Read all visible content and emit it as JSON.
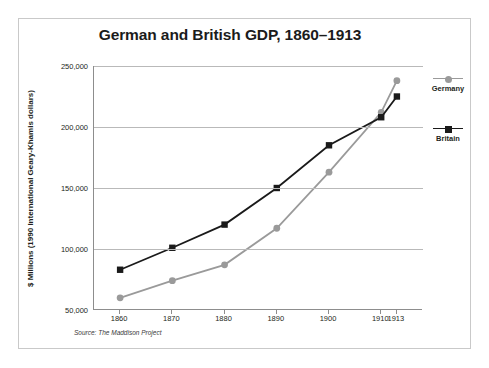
{
  "figure": {
    "title": "German and British GDP, 1860–1913",
    "source_note": "Source: The Maddison Project"
  },
  "legend": {
    "items": [
      {
        "label": "Germany",
        "color": "#9a9a9a",
        "marker": "circle"
      },
      {
        "label": "Britain",
        "color": "#1a1a1a",
        "marker": "square"
      }
    ]
  },
  "axes": {
    "y_title": "$ Millions  (1990 International Geary-Khamis dollars)",
    "y_ticks": [
      "250,000",
      "200,000",
      "150,000",
      "100,000",
      "50,000"
    ],
    "x_ticks": [
      "1860",
      "1870",
      "1880",
      "1890",
      "1900",
      "1910",
      "1913"
    ]
  },
  "chart_data": {
    "type": "line",
    "title": "German and British GDP, 1860–1913",
    "xlabel": "",
    "ylabel": "$ Millions  (1990 International Geary-Khamis dollars)",
    "x": [
      1860,
      1870,
      1880,
      1890,
      1900,
      1910,
      1913
    ],
    "categories": [
      "1860",
      "1870",
      "1880",
      "1890",
      "1900",
      "1910",
      "1913"
    ],
    "series": [
      {
        "name": "Germany",
        "color": "#9a9a9a",
        "marker": "circle",
        "values": [
          60000,
          74000,
          87000,
          117000,
          163000,
          212000,
          238000
        ]
      },
      {
        "name": "Britain",
        "color": "#1a1a1a",
        "marker": "square",
        "values": [
          83000,
          101000,
          120000,
          150000,
          185000,
          208000,
          225000
        ]
      }
    ],
    "ylim": [
      50000,
      250000
    ],
    "ytick_values": [
      250000,
      200000,
      150000,
      100000,
      50000
    ],
    "xlim": [
      1855,
      1918
    ],
    "grid": "horizontal",
    "legend_position": "right",
    "annotations": [
      "Source: The Maddison Project"
    ]
  }
}
